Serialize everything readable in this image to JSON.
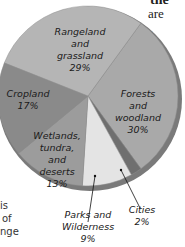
{
  "page_text": {
    "top_fragment_1": "the",
    "top_fragment_2": "are",
    "top_fragment_3": ".",
    "side_fragment_1": "is",
    "side_fragment_2": "of",
    "side_fragment_3": "nge"
  },
  "chart_data": {
    "type": "pie",
    "title": "",
    "categories": [
      "Forests and woodland",
      "Cities",
      "Parks and Wilderness",
      "Wetlands, tundra, and deserts",
      "Cropland",
      "Rangeland and grassland"
    ],
    "values": [
      30,
      2,
      9,
      13,
      17,
      29
    ],
    "unit": "%",
    "colors": [
      "#a9a9a9",
      "#6f6f6f",
      "#e4e4e4",
      "#9c9c9c",
      "#8a8a8a",
      "#b5b5b5"
    ],
    "labels": {
      "forests": [
        "Forests",
        "and",
        "woodland",
        "30%"
      ],
      "cities": [
        "Cities",
        "2%"
      ],
      "parks": [
        "Parks and",
        "Wilderness",
        "9%"
      ],
      "wetlands": [
        "Wetlands,",
        "tundra,",
        "and",
        "deserts",
        "13%"
      ],
      "cropland": [
        "Cropland",
        "17%"
      ],
      "rangeland": [
        "Rangeland",
        "and",
        "grassland",
        "29%"
      ]
    },
    "legend": "none (labels placed on slices)"
  }
}
